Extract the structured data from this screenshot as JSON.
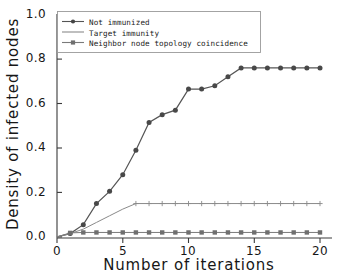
{
  "chart_data": {
    "type": "line",
    "title": "",
    "xlabel": "Number of iterations",
    "ylabel": "Density of infected nodes",
    "xlim": [
      0,
      20
    ],
    "ylim": [
      0,
      1.0
    ],
    "xticks": [
      "0",
      "5",
      "10",
      "15",
      "20"
    ],
    "xtick_values": [
      0,
      5,
      10,
      15,
      20
    ],
    "yticks": [
      "0.0",
      "0.2",
      "0.4",
      "0.6",
      "0.8",
      "1.0"
    ],
    "ytick_values": [
      0.0,
      0.2,
      0.4,
      0.6,
      0.8,
      1.0
    ],
    "grid": false,
    "legend_position": "upper-left",
    "x": [
      0,
      1,
      2,
      3,
      4,
      5,
      6,
      7,
      8,
      9,
      10,
      11,
      12,
      13,
      14,
      15,
      16,
      17,
      18,
      19,
      20
    ],
    "series": [
      {
        "name": "Not immunized",
        "marker": "circle",
        "color": "#555555",
        "values": [
          0.0,
          0.015,
          0.055,
          0.15,
          0.205,
          0.28,
          0.39,
          0.515,
          0.55,
          0.57,
          0.665,
          0.665,
          0.68,
          0.72,
          0.76,
          0.76,
          0.76,
          0.76,
          0.76,
          0.76,
          0.76
        ]
      },
      {
        "name": "Target immunity",
        "marker": "plus",
        "color": "#8a8a8a",
        "values": [
          0.0,
          0.015,
          0.035,
          0.065,
          0.095,
          0.125,
          0.15,
          0.15,
          0.15,
          0.15,
          0.15,
          0.15,
          0.15,
          0.15,
          0.15,
          0.15,
          0.15,
          0.15,
          0.15,
          0.15,
          0.15
        ]
      },
      {
        "name": "Neighbor node topology coincidence",
        "marker": "square",
        "color": "#7a7a7a",
        "values": [
          0.0,
          0.018,
          0.02,
          0.02,
          0.02,
          0.02,
          0.02,
          0.02,
          0.02,
          0.02,
          0.02,
          0.02,
          0.02,
          0.02,
          0.02,
          0.02,
          0.02,
          0.02,
          0.02,
          0.02,
          0.02
        ]
      }
    ]
  },
  "legend": {
    "items": [
      {
        "label": "Not immunized"
      },
      {
        "label": "Target immunity"
      },
      {
        "label": "Neighbor node topology coincidence"
      }
    ]
  },
  "axes": {
    "x_title": "Number of iterations",
    "y_title": "Density of infected nodes",
    "y_tick_labels": [
      "1.0",
      "0.8",
      "0.6",
      "0.4",
      "0.2",
      "0.0"
    ],
    "x_tick_labels": [
      "0",
      "5",
      "10",
      "15",
      "20"
    ]
  }
}
